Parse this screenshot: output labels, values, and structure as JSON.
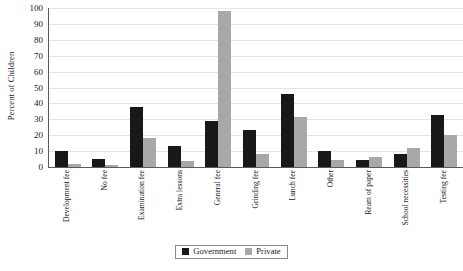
{
  "chart_data": {
    "type": "bar",
    "title": "",
    "xlabel": "",
    "ylabel": "Percent of Children",
    "ylim": [
      0,
      100
    ],
    "yticks": [
      0,
      10,
      20,
      30,
      40,
      50,
      60,
      70,
      80,
      90,
      100
    ],
    "grid": true,
    "legend_position": "bottom-center",
    "categories": [
      "Development fee",
      "No fee",
      "Examination fee",
      "Extra lessons",
      "General fee",
      "Grinding fee",
      "Lunch fee",
      "Other",
      "Ream of paper",
      "School necessities",
      "Testing fee"
    ],
    "series": [
      {
        "name": "Government",
        "color": "#181818",
        "values": [
          10,
          5,
          38,
          13.5,
          29,
          23,
          46,
          10,
          4.5,
          8,
          33
        ]
      },
      {
        "name": "Private",
        "color": "#a8a8a8",
        "values": [
          2,
          1,
          18.5,
          3.5,
          98,
          8,
          31.5,
          4.5,
          6,
          12,
          20
        ]
      }
    ]
  }
}
